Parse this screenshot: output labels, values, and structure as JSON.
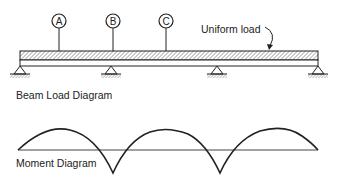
{
  "beam_diagram": {
    "title": "Beam Load Diagram",
    "load_label": "Uniform load",
    "markers": [
      {
        "label": "A",
        "x": 59
      },
      {
        "label": "B",
        "x": 113
      },
      {
        "label": "C",
        "x": 166
      }
    ],
    "supports_x": [
      20,
      111,
      217,
      318
    ],
    "beam": {
      "x_start": 20,
      "x_end": 318
    }
  },
  "moment_diagram": {
    "title": "Moment Diagram",
    "baseline_y": 150,
    "cusps_x": [
      113,
      220
    ]
  },
  "colors": {
    "line": "#222222",
    "background": "#ffffff"
  }
}
